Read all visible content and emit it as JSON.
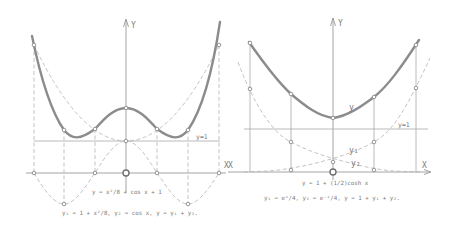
{
  "left_diagram": {
    "axis_labels": {
      "y": "Y",
      "x": "X"
    },
    "line_label": "y=1",
    "formula_main": "y = x²/8 + cos x + 1",
    "formula_parts": "y₁ = 1 + x²/8,  y₂ = cos x,  y = y₁ + y₂.",
    "curves": [
      {
        "name": "y",
        "style": "bold"
      },
      {
        "name": "y1 = 1 + x²/8",
        "style": "dashed parabola"
      },
      {
        "name": "y2 = cos x",
        "style": "dashed"
      }
    ]
  },
  "right_diagram": {
    "axis_labels": {
      "y": "Y",
      "x": "X",
      "x_left": "X"
    },
    "line_label": "y=1",
    "curve_label_y": "y",
    "curve_label_y1": "y₁",
    "curve_label_y2": "y₂",
    "formula_main": "y = 1 + (1/2)cosh x",
    "formula_parts": "y₁ = eˣ/4,  y₂ = e⁻ˣ/4,  y = 1 + y₁ + y₂.",
    "curves": [
      {
        "name": "y",
        "style": "bold"
      },
      {
        "name": "y1 = e^x/4",
        "style": "dashed"
      },
      {
        "name": "y2 = e^-x/4",
        "style": "dashed"
      }
    ]
  },
  "colors": {
    "background": "#ffffff",
    "bold_curve": "#8c8c8c",
    "lines": "#a8a8a8",
    "text": "#7a7a7a"
  }
}
